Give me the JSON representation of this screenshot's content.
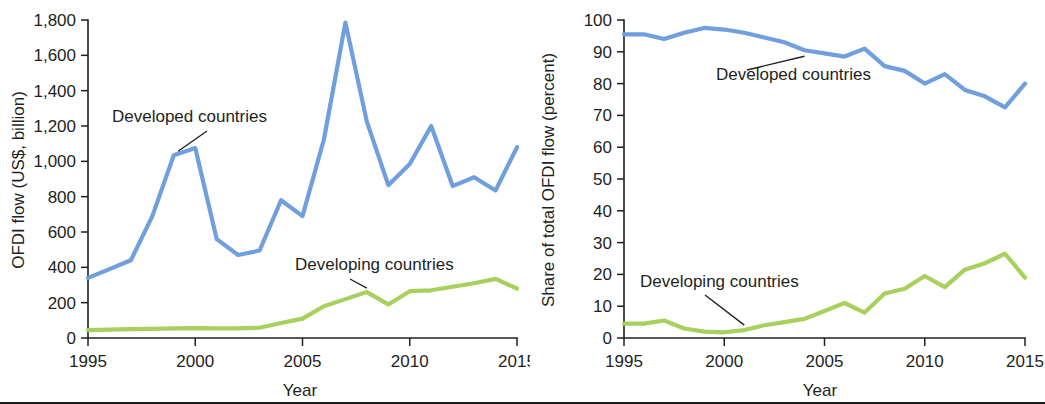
{
  "figure": {
    "panels": [
      {
        "id": "ofdi-flow-levels",
        "xlabel": "Year",
        "ylabel": "OFDI flow (US$, billion)"
      },
      {
        "id": "ofdi-flow-shares",
        "xlabel": "Year",
        "ylabel": "Share of total OFDI flow (percent)"
      }
    ],
    "colors": {
      "developed": "#6f9fdc",
      "developing": "#a8d05c",
      "axis": "#231f20",
      "text": "#231f20",
      "background": "#ffffff"
    }
  },
  "chart_data": [
    {
      "type": "line",
      "title": "",
      "xlabel": "Year",
      "ylabel": "OFDI flow (US$, billion)",
      "xlim": [
        1995,
        2015
      ],
      "ylim": [
        0,
        1800
      ],
      "ytick_labels": [
        "0",
        "200",
        "400",
        "600",
        "800",
        "1,000",
        "1,200",
        "1,400",
        "1,600",
        "1,800"
      ],
      "yticks": [
        0,
        200,
        400,
        600,
        800,
        1000,
        1200,
        1400,
        1600,
        1800
      ],
      "xtick_labels": [
        "1995",
        "2000",
        "2005",
        "2010",
        "2015"
      ],
      "xticks": [
        1995,
        2000,
        2005,
        2010,
        2015
      ],
      "grid": false,
      "legend": "inline-annotations",
      "x": [
        1995,
        1996,
        1997,
        1998,
        1999,
        2000,
        2001,
        2002,
        2003,
        2004,
        2005,
        2006,
        2007,
        2008,
        2009,
        2010,
        2011,
        2012,
        2013,
        2014,
        2015
      ],
      "series": [
        {
          "name": "Developed countries",
          "color": "#6f9fdc",
          "values": [
            340,
            390,
            440,
            690,
            1035,
            1075,
            560,
            470,
            495,
            780,
            690,
            1125,
            1785,
            1225,
            865,
            985,
            1200,
            860,
            910,
            835,
            1080
          ]
        },
        {
          "name": "Developing countries",
          "color": "#a8d05c",
          "values": [
            45,
            47,
            50,
            52,
            55,
            56,
            54,
            54,
            58,
            85,
            110,
            180,
            220,
            260,
            190,
            265,
            270,
            290,
            310,
            335,
            280
          ]
        }
      ],
      "annotations": [
        {
          "text": "Developed countries",
          "anchor_year": 1999.2,
          "anchor_value": 1035
        },
        {
          "text": "Developing countries",
          "anchor_year": 2008,
          "anchor_value": 260
        }
      ]
    },
    {
      "type": "line",
      "title": "",
      "xlabel": "Year",
      "ylabel": "Share of total OFDI flow (percent)",
      "xlim": [
        1995,
        2015
      ],
      "ylim": [
        0,
        100
      ],
      "ytick_labels": [
        "0",
        "10",
        "20",
        "30",
        "40",
        "50",
        "60",
        "70",
        "80",
        "90",
        "100"
      ],
      "yticks": [
        0,
        10,
        20,
        30,
        40,
        50,
        60,
        70,
        80,
        90,
        100
      ],
      "xtick_labels": [
        "1995",
        "2000",
        "2005",
        "2010",
        "2015"
      ],
      "xticks": [
        1995,
        2000,
        2005,
        2010,
        2015
      ],
      "grid": false,
      "legend": "inline-annotations",
      "x": [
        1995,
        1996,
        1997,
        1998,
        1999,
        2000,
        2001,
        2002,
        2003,
        2004,
        2005,
        2006,
        2007,
        2008,
        2009,
        2010,
        2011,
        2012,
        2013,
        2014,
        2015
      ],
      "series": [
        {
          "name": "Developed countries",
          "color": "#6f9fdc",
          "values": [
            95.5,
            95.5,
            94.0,
            96.0,
            97.5,
            97.0,
            96.0,
            94.5,
            93.0,
            90.5,
            89.5,
            88.5,
            91.0,
            85.5,
            84.0,
            80.0,
            83.0,
            78.0,
            76.0,
            72.5,
            80.0
          ]
        },
        {
          "name": "Developing countries",
          "color": "#a8d05c",
          "values": [
            4.5,
            4.5,
            5.5,
            3.0,
            2.0,
            1.8,
            2.5,
            4.0,
            5.0,
            6.0,
            8.5,
            11.0,
            8.0,
            14.0,
            15.5,
            19.5,
            16.0,
            21.5,
            23.5,
            26.5,
            19.0
          ]
        }
      ],
      "annotations": [
        {
          "text": "Developed countries",
          "anchor_year": 2004,
          "anchor_value": 90.5
        },
        {
          "text": "Developing countries",
          "anchor_year": 2001,
          "anchor_value": 2.5
        }
      ]
    }
  ]
}
